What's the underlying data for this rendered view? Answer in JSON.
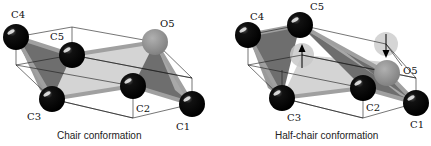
{
  "figure": {
    "panels": [
      {
        "id": "chair",
        "caption": "Chair conformation",
        "atoms": [
          {
            "label": "C1",
            "x": 192,
            "y": 104,
            "color": "#000000",
            "label_x": 178,
            "label_y": 130
          },
          {
            "label": "C2",
            "x": 133,
            "y": 86,
            "color": "#000000",
            "label_x": 136,
            "label_y": 112
          },
          {
            "label": "C3",
            "x": 52,
            "y": 99,
            "color": "#000000",
            "label_x": 27,
            "label_y": 120
          },
          {
            "label": "C4",
            "x": 16,
            "y": 37,
            "color": "#000000",
            "label_x": 11,
            "label_y": 18
          },
          {
            "label": "C5",
            "x": 72,
            "y": 55,
            "color": "#000000",
            "label_x": 50,
            "label_y": 40
          },
          {
            "label": "O5",
            "x": 155,
            "y": 42,
            "color": "#8c8c8c",
            "label_x": 160,
            "label_y": 27
          }
        ]
      },
      {
        "id": "half-chair",
        "caption": "Half-chair conformation",
        "atoms": [
          {
            "label": "C1",
            "x": 416,
            "y": 103,
            "color": "#000000",
            "label_x": 411,
            "label_y": 128
          },
          {
            "label": "C2",
            "x": 363,
            "y": 88,
            "color": "#000000",
            "label_x": 366,
            "label_y": 111
          },
          {
            "label": "C3",
            "x": 282,
            "y": 98,
            "color": "#000000",
            "label_x": 287,
            "label_y": 121
          },
          {
            "label": "C4",
            "x": 248,
            "y": 35,
            "color": "#000000",
            "label_x": 250,
            "label_y": 20
          },
          {
            "label": "C5",
            "x": 300,
            "y": 25,
            "color": "#000000",
            "label_x": 310,
            "label_y": 10
          },
          {
            "label": "O5",
            "x": 387,
            "y": 73,
            "color": "#8c8c8c",
            "label_x": 403,
            "label_y": 74
          }
        ],
        "ghost_atoms": [
          {
            "of": "C5",
            "x": 302,
            "y": 55
          },
          {
            "of": "O5",
            "x": 386,
            "y": 44
          }
        ]
      }
    ],
    "colors": {
      "atom_carbon": "#000000",
      "atom_oxygen": "#8c8c8c",
      "ghost_atom": "#c8c8c8",
      "plane_light": "#d4d4d4",
      "plane_dark": "#6e6e6e",
      "bond": "#a0a0a0",
      "outline": "#1a1a1a"
    }
  }
}
